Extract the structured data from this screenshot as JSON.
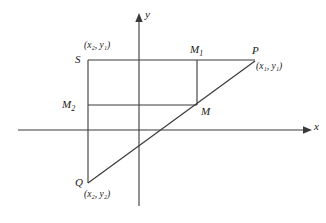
{
  "figure": {
    "stroke_color": "#3a3a3a",
    "label_color": "#1a1a1a",
    "background": "#ffffff"
  },
  "axes": {
    "x_label": "x",
    "y_label": "y",
    "x_axis": {
      "x1": 18,
      "y1": 130,
      "x2": 311,
      "y2": 130
    },
    "y_axis": {
      "x1": 139,
      "y1": 14,
      "x2": 139,
      "y2": 206
    }
  },
  "points": {
    "P": {
      "label": "P",
      "coord_text": "(x",
      "coord_sub1": "1",
      "coord_mid": ", y",
      "coord_sub2": "1",
      "coord_end": ")",
      "x": 255,
      "y": 60
    },
    "Q": {
      "label": "Q",
      "coord_text": "(x",
      "coord_sub1": "2",
      "coord_mid": ", y",
      "coord_sub2": "2",
      "coord_end": ")",
      "x": 88,
      "y": 183
    },
    "S": {
      "label": "S",
      "coord_text": "(x",
      "coord_sub1": "2",
      "coord_mid": ", y",
      "coord_sub2": "1",
      "coord_end": ")",
      "x": 88,
      "y": 60
    },
    "M": {
      "label": "M",
      "x": 197,
      "y": 105
    },
    "M1": {
      "label": "M",
      "sub": "1",
      "x": 197,
      "y": 60
    },
    "M2": {
      "label": "M",
      "sub": "2",
      "x": 88,
      "y": 105
    }
  },
  "labels": {
    "P_name": "P",
    "Q_name": "Q",
    "S_name": "S",
    "M_name": "M",
    "M1_name": "M",
    "M1_sub": "1",
    "M2_name": "M",
    "M2_sub": "2",
    "P_coord": "(x₁, y₁)",
    "Q_coord": "(x₂, y₂)",
    "S_coord": "(x₂, y₁)",
    "x_axis_label": "x",
    "y_axis_label": "y"
  },
  "segments": {
    "segment_PQ": {
      "from": "Q",
      "to": "P",
      "description": "diagonal line from Q to P through M"
    },
    "segment_SP": {
      "from": "S",
      "to": "P",
      "description": "top horizontal line from S to P"
    },
    "segment_SQ": {
      "from": "S",
      "to": "Q",
      "description": "left vertical line from S down to Q"
    },
    "segment_M2M": {
      "from": "M2",
      "to": "M",
      "description": "horizontal line from M2 to M"
    },
    "segment_M1M": {
      "from": "M1",
      "to": "M",
      "description": "vertical line from M1 down to M"
    }
  }
}
